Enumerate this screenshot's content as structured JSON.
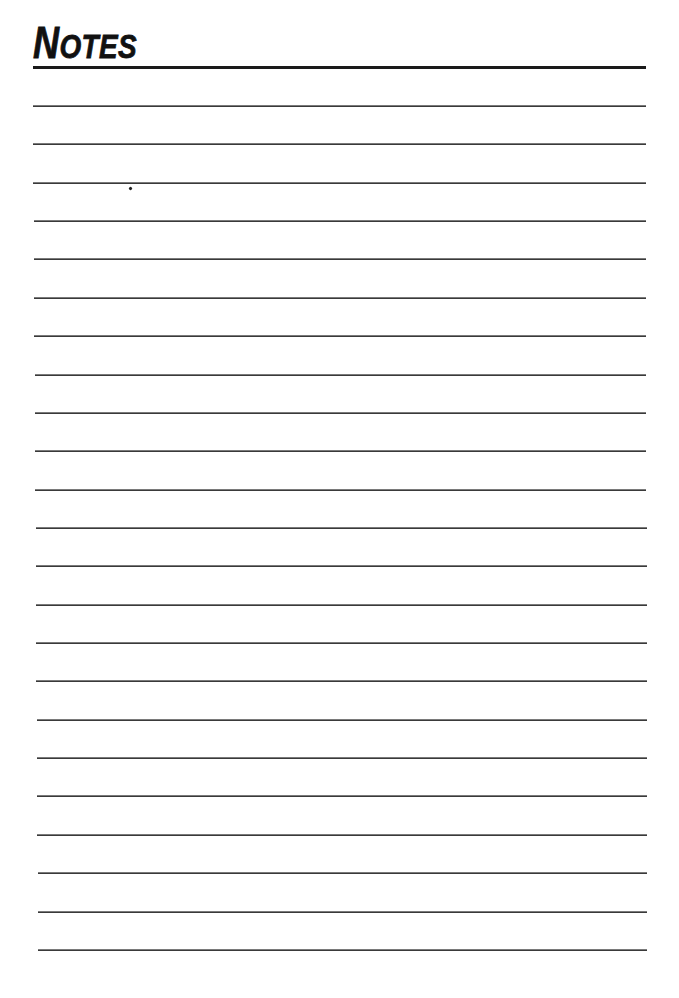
{
  "page": {
    "title_first_letter": "N",
    "title_rest": "otes",
    "title_full": "Notes",
    "ruled_line_count": 23,
    "ruled_line_first_y": 105,
    "ruled_line_spacing": 38.36,
    "colors": {
      "ink": "#111111",
      "rule": "#3a3a3a",
      "paper": "#ffffff"
    }
  }
}
